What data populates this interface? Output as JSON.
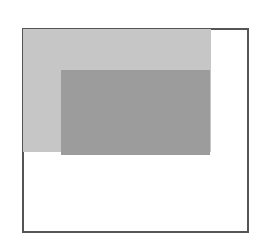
{
  "diagram": {
    "frame": {
      "x": 22,
      "y": 28,
      "width": 227,
      "height": 205,
      "border_color": "#555555",
      "fill": "#ffffff"
    },
    "regions": [
      {
        "name": "outer-region",
        "x": 23,
        "y": 29,
        "width": 188,
        "height": 123,
        "fill": "#c6c6c6"
      },
      {
        "name": "inner-region",
        "x": 61,
        "y": 70,
        "width": 149,
        "height": 85,
        "fill": "#9c9c9c"
      }
    ]
  }
}
